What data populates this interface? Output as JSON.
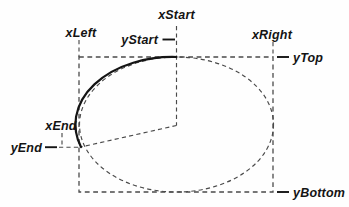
{
  "figure": {
    "colors": {
      "background": "#fefefe",
      "ink": "#141414",
      "dash": "#4a4a4a"
    },
    "labels": {
      "x_start": "xStart",
      "y_start": "yStart",
      "x_left": "xLeft",
      "x_right": "xRight",
      "y_top": "yTop",
      "x_end": "xEnd",
      "y_end": "yEnd",
      "y_bottom": "yBottom"
    }
  }
}
